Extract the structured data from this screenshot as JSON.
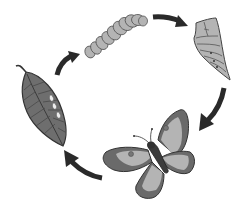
{
  "diagram": {
    "type": "life-cycle",
    "stages": [
      {
        "id": "eggs",
        "label": "eggs on leaf",
        "order": 1
      },
      {
        "id": "larva",
        "label": "caterpillar",
        "order": 2
      },
      {
        "id": "pupa",
        "label": "chrysalis",
        "order": 3
      },
      {
        "id": "adult",
        "label": "butterfly",
        "order": 4
      }
    ],
    "arrows": [
      {
        "from": "eggs",
        "to": "larva"
      },
      {
        "from": "larva",
        "to": "pupa"
      },
      {
        "from": "pupa",
        "to": "adult"
      },
      {
        "from": "adult",
        "to": "eggs"
      }
    ],
    "colors": {
      "background": "#ffffff",
      "arrow": "#2a2a2a",
      "outline": "#333333",
      "leaf": "#6e6e6e",
      "light_gray": "#b4b4b4",
      "dark_wing": "#6a6a6a",
      "egg": "#e8e8e8",
      "body": "#3c3c3c"
    }
  }
}
